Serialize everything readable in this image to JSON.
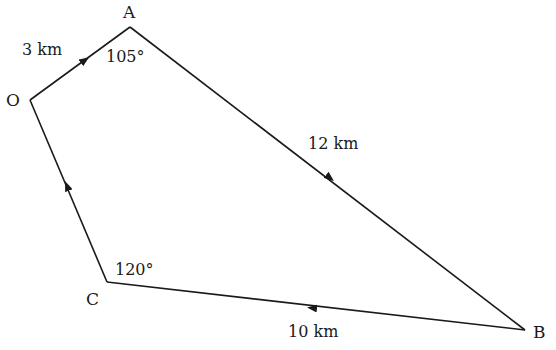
{
  "diagram": {
    "type": "vector-path-quadrilateral",
    "points": {
      "O": {
        "label": "O",
        "x": 30,
        "y": 100
      },
      "A": {
        "label": "A",
        "x": 130,
        "y": 27
      },
      "B": {
        "label": "B",
        "x": 525,
        "y": 330
      },
      "C": {
        "label": "C",
        "x": 107,
        "y": 282
      }
    },
    "segments": [
      {
        "from": "O",
        "to": "A",
        "length_label": "3 km",
        "arrow": "toward A"
      },
      {
        "from": "A",
        "to": "B",
        "length_label": "12 km",
        "arrow": "toward B"
      },
      {
        "from": "B",
        "to": "C",
        "length_label": "10 km",
        "arrow": "toward C"
      },
      {
        "from": "C",
        "to": "O",
        "length_label": "",
        "arrow": "toward O"
      }
    ],
    "angles": {
      "A": "105°",
      "C": "120°"
    },
    "colors": {
      "line": "#1a1a1a",
      "background": "#ffffff"
    }
  }
}
